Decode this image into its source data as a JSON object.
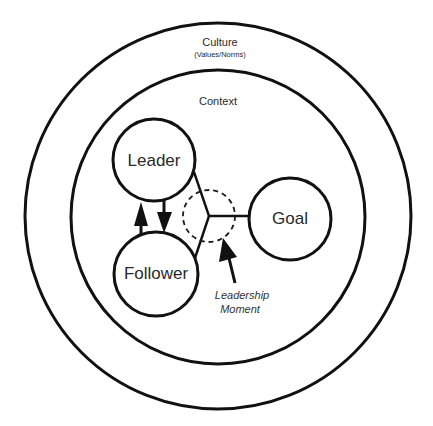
{
  "diagram": {
    "outer_ring": {
      "label": "Culture",
      "sublabel": "(Values/Norms)"
    },
    "inner_ring": {
      "label": "Context"
    },
    "nodes": {
      "leader": {
        "label": "Leader"
      },
      "follower": {
        "label": "Follower"
      },
      "goal": {
        "label": "Goal"
      }
    },
    "moment": {
      "label_line1": "Leadership",
      "label_line2": "Moment"
    },
    "colors": {
      "stroke": "#111111",
      "text": "#2a2a2a",
      "background": "#ffffff"
    }
  }
}
